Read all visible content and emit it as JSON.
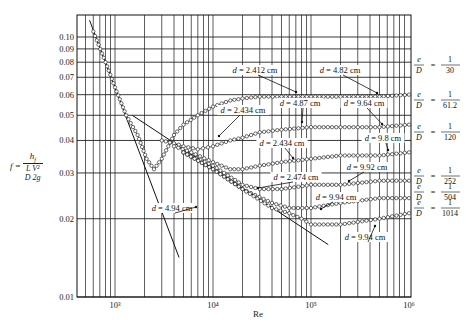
{
  "chart_data": {
    "type": "scatter",
    "title": "",
    "xlabel": "Re",
    "ylabel": "f = h_f / ((L/D)(V^2/2g))",
    "xscale": "log",
    "yscale": "log",
    "xlim": [
      500,
      1000000
    ],
    "ylim": [
      0.01,
      0.12
    ],
    "grid": true,
    "x_ticks": [
      {
        "value": 1000,
        "label": "10³"
      },
      {
        "value": 10000,
        "label": "10⁴"
      },
      {
        "value": 100000,
        "label": "10⁵"
      },
      {
        "value": 1000000,
        "label": "10⁶"
      }
    ],
    "y_ticks": [
      {
        "value": 0.1,
        "label": "0.10"
      },
      {
        "value": 0.09,
        "label": "0.09"
      },
      {
        "value": 0.08,
        "label": "0.08"
      },
      {
        "value": 0.07,
        "label": "0.07"
      },
      {
        "value": 0.06,
        "label": "0.06"
      },
      {
        "value": 0.05,
        "label": "0.05"
      },
      {
        "value": 0.04,
        "label": "0.04"
      },
      {
        "value": 0.03,
        "label": "0.03"
      },
      {
        "value": 0.02,
        "label": "0.02"
      },
      {
        "value": 0.01,
        "label": "0.01"
      }
    ],
    "lines": [
      {
        "name": "laminar f = 64/Re",
        "x": [
          550,
          4500
        ],
        "y": [
          0.116,
          0.0142
        ]
      },
      {
        "name": "smooth pipe (Blasius)",
        "x": [
          1500,
          150000
        ],
        "y": [
          0.05,
          0.0159
        ]
      }
    ],
    "series": [
      {
        "name": "e/D = 1/30",
        "roughness_label": "1/30",
        "x": [
          600,
          800,
          1000,
          1300,
          1700,
          2100,
          2500,
          3000,
          3500,
          4000,
          5000,
          7000,
          10000,
          15000,
          20000,
          30000,
          50000,
          100000,
          200000,
          500000,
          1000000
        ],
        "y": [
          0.105,
          0.08,
          0.064,
          0.05,
          0.042,
          0.034,
          0.031,
          0.034,
          0.038,
          0.042,
          0.046,
          0.05,
          0.054,
          0.057,
          0.058,
          0.059,
          0.059,
          0.059,
          0.059,
          0.059,
          0.06
        ]
      },
      {
        "name": "e/D = 1/61.2",
        "roughness_label": "1/61.2",
        "x": [
          3000,
          4000,
          5000,
          7000,
          10000,
          15000,
          20000,
          30000,
          50000,
          100000,
          200000,
          500000,
          1000000
        ],
        "y": [
          0.04,
          0.039,
          0.038,
          0.037,
          0.038,
          0.04,
          0.041,
          0.043,
          0.044,
          0.045,
          0.045,
          0.045,
          0.046
        ]
      },
      {
        "name": "e/D = 1/120",
        "roughness_label": "1/120",
        "x": [
          4000,
          6000,
          10000,
          15000,
          20000,
          30000,
          50000,
          100000,
          200000,
          500000,
          1000000
        ],
        "y": [
          0.038,
          0.036,
          0.033,
          0.031,
          0.031,
          0.032,
          0.033,
          0.034,
          0.035,
          0.035,
          0.036
        ]
      },
      {
        "name": "e/D = 1/252",
        "roughness_label": "1/252",
        "x": [
          5000,
          10000,
          20000,
          30000,
          50000,
          100000,
          200000,
          500000,
          1000000
        ],
        "y": [
          0.036,
          0.032,
          0.027,
          0.026,
          0.026,
          0.027,
          0.027,
          0.028,
          0.028
        ]
      },
      {
        "name": "e/D = 1/504",
        "roughness_label": "1/504",
        "x": [
          5000,
          10000,
          20000,
          40000,
          60000,
          100000,
          200000,
          500000,
          1000000
        ],
        "y": [
          0.036,
          0.031,
          0.026,
          0.023,
          0.022,
          0.022,
          0.023,
          0.024,
          0.024
        ]
      },
      {
        "name": "e/D = 1/1014",
        "roughness_label": "1/1014",
        "x": [
          5000,
          10000,
          20000,
          40000,
          60000,
          80000,
          100000,
          200000,
          500000,
          1000000
        ],
        "y": [
          0.036,
          0.031,
          0.026,
          0.022,
          0.021,
          0.02,
          0.019,
          0.019,
          0.02,
          0.021
        ]
      }
    ],
    "annotations": [
      {
        "text": "d = 2.412 cm",
        "target_series": "e/D = 1/30"
      },
      {
        "text": "d = 4.82 cm",
        "target_series": "e/D = 1/30"
      },
      {
        "text": "d = 4.87 cm",
        "target_series": "e/D = 1/61.2"
      },
      {
        "text": "d = 9.64 cm",
        "target_series": "e/D = 1/61.2"
      },
      {
        "text": "d = 2.434 cm",
        "target_series": "e/D = 1/61.2"
      },
      {
        "text": "d = 9.8 cm",
        "target_series": "e/D = 1/120"
      },
      {
        "text": "d = 2.434 cm",
        "target_series": "e/D = 1/120"
      },
      {
        "text": "d = 9.92 cm",
        "target_series": "e/D = 1/252"
      },
      {
        "text": "d = 2.474 cm",
        "target_series": "e/D = 1/252"
      },
      {
        "text": "d = 9.94 cm",
        "target_series": "e/D = 1/504"
      },
      {
        "text": "d = 4.94 cm",
        "target_series": "e/D = 1/504"
      },
      {
        "text": "d = 9.94 cm",
        "target_series": "e/D = 1/1014"
      }
    ],
    "legend_position": "right (inline relative-roughness labels)"
  },
  "labels": {
    "ylabel_f": "f =",
    "ylabel_num": "h",
    "ylabel_num_sub": "f",
    "ylabel_den": "L  V²",
    "ylabel_den2": "D  2g",
    "xlabel": "Re",
    "eD_prefix_num": "e",
    "eD_prefix_den": "D",
    "eD_eq": "=",
    "eD_one": "1"
  }
}
